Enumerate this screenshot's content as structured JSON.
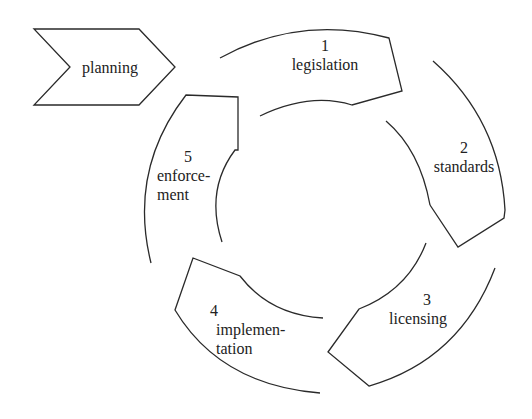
{
  "diagram": {
    "title": "",
    "start": {
      "label": "planning"
    },
    "stages": [
      {
        "number": "1",
        "label": "legislation"
      },
      {
        "number": "2",
        "label": "standards"
      },
      {
        "number": "3",
        "label": "licensing"
      },
      {
        "number": "4",
        "label_line1": "implemen-",
        "label_line2": "tation"
      },
      {
        "number": "5",
        "label_line1": "enforce-",
        "label_line2": "ment"
      }
    ],
    "colors": {
      "stroke": "#2a2a2a",
      "background": "#ffffff",
      "text": "#222222"
    }
  }
}
